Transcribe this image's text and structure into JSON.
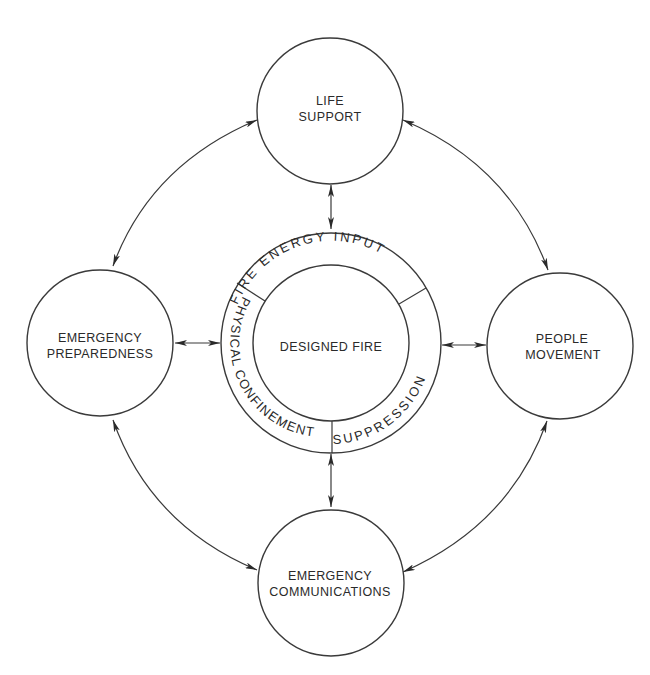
{
  "diagram": {
    "center": {
      "label": "DESIGNED FIRE",
      "ring_segments": [
        {
          "id": "fire-energy-input",
          "label": "FIRE ENERGY INPUT"
        },
        {
          "id": "suppression",
          "label": "SUPPRESSION"
        },
        {
          "id": "physical-confinement",
          "label": "PHYSICAL CONFINEMENT"
        }
      ]
    },
    "nodes": [
      {
        "id": "life-support",
        "lines": [
          "LIFE",
          "SUPPORT"
        ]
      },
      {
        "id": "emergency-preparedness",
        "lines": [
          "EMERGENCY",
          "PREPAREDNESS"
        ]
      },
      {
        "id": "people-movement",
        "lines": [
          "PEOPLE",
          "MOVEMENT"
        ]
      },
      {
        "id": "emergency-communications",
        "lines": [
          "EMERGENCY",
          "COMMUNICATIONS"
        ]
      }
    ],
    "connections": [
      {
        "from": "life-support",
        "to": "designed-fire",
        "type": "bidirectional"
      },
      {
        "from": "emergency-preparedness",
        "to": "designed-fire",
        "type": "bidirectional"
      },
      {
        "from": "people-movement",
        "to": "designed-fire",
        "type": "bidirectional"
      },
      {
        "from": "emergency-communications",
        "to": "designed-fire",
        "type": "bidirectional"
      },
      {
        "from": "life-support",
        "to": "emergency-preparedness",
        "type": "bidirectional"
      },
      {
        "from": "life-support",
        "to": "people-movement",
        "type": "bidirectional"
      },
      {
        "from": "emergency-preparedness",
        "to": "emergency-communications",
        "type": "bidirectional"
      },
      {
        "from": "people-movement",
        "to": "emergency-communications",
        "type": "bidirectional"
      }
    ],
    "colors": {
      "line": "#3a3a3a",
      "text": "#2a2a2a",
      "background": "#ffffff"
    }
  }
}
